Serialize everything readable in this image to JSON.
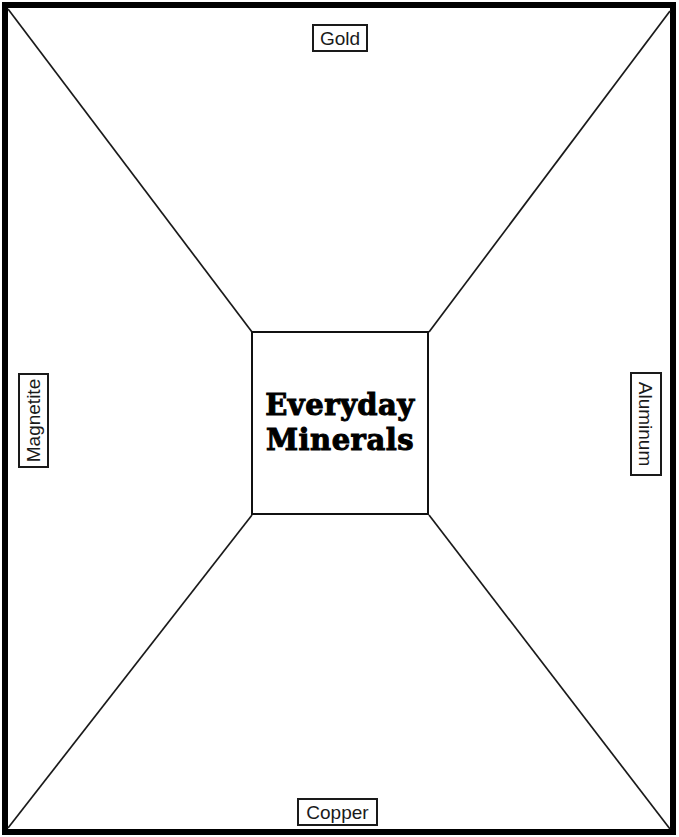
{
  "diagram": {
    "center": {
      "title_line1": "Everyday",
      "title_line2": "Minerals"
    },
    "labels": {
      "top": "Gold",
      "left": "Magnetite",
      "right": "Aluminum",
      "bottom": "Copper"
    },
    "colors": {
      "line": "#000000",
      "background": "#ffffff",
      "text": "#000000"
    }
  }
}
